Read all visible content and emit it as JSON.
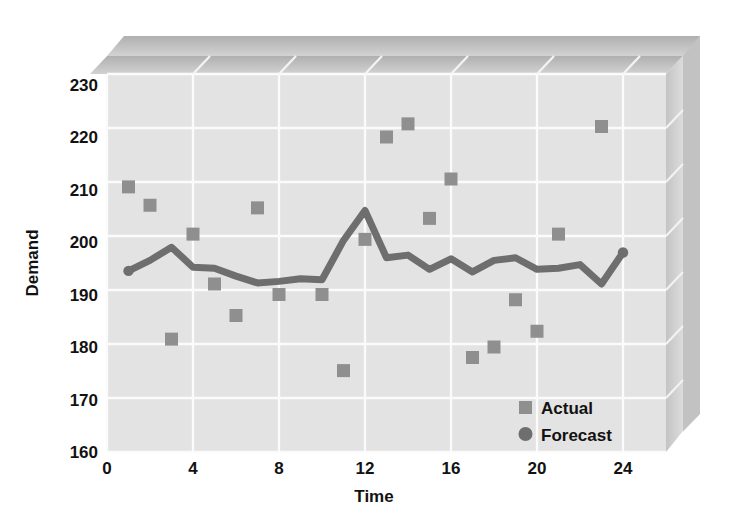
{
  "chart_data": {
    "type": "scatter",
    "title": "",
    "xlabel": "Time",
    "ylabel": "Demand",
    "xlim": [
      0,
      26
    ],
    "ylim": [
      160,
      232
    ],
    "xticks": [
      0,
      4,
      8,
      12,
      16,
      20,
      24
    ],
    "yticks": [
      160,
      170,
      180,
      190,
      200,
      210,
      220,
      230
    ],
    "grid": true,
    "legend_position": "bottom-right",
    "x": [
      1,
      2,
      3,
      4,
      5,
      6,
      7,
      8,
      9,
      10,
      11,
      12,
      13,
      14,
      15,
      16,
      17,
      18,
      19,
      20,
      21,
      22,
      23,
      24
    ],
    "series": [
      {
        "name": "Actual",
        "marker": "square",
        "color": "#8f8f8f",
        "x": [
          1,
          2,
          3,
          4,
          5,
          6,
          7,
          8,
          10,
          11,
          12,
          13,
          14,
          15,
          16,
          17,
          18,
          19,
          20,
          21,
          23
        ],
        "values": [
          210.5,
          207,
          181.5,
          201.5,
          192,
          186,
          206.5,
          190,
          190,
          175.5,
          200.5,
          220,
          222.5,
          204.5,
          212,
          178,
          180,
          189,
          183,
          201.5,
          222
        ]
      },
      {
        "name": "Forecast",
        "marker": "circle",
        "color": "#6e6e6e",
        "x": [
          1,
          2,
          3,
          4,
          5,
          6,
          7,
          8,
          9,
          10,
          11,
          12,
          13,
          14,
          15,
          16,
          17,
          18,
          19,
          20,
          21,
          22,
          23,
          24
        ],
        "values": [
          194.5,
          196.5,
          199,
          195.2,
          195,
          193.5,
          192.2,
          192.5,
          193,
          192.8,
          200.3,
          206,
          197,
          197.5,
          194.8,
          196.8,
          194.3,
          196.5,
          197,
          194.8,
          195,
          195.7,
          192,
          198
        ]
      }
    ]
  },
  "axes": {
    "ylabel": "Demand",
    "xlabel": "Time",
    "yticks": [
      "230",
      "220",
      "210",
      "200",
      "190",
      "180",
      "170",
      "160"
    ],
    "xticks": [
      "0",
      "4",
      "8",
      "12",
      "16",
      "20",
      "24"
    ]
  },
  "legend": {
    "items": [
      {
        "label": "Actual",
        "marker": "square"
      },
      {
        "label": "Forecast",
        "marker": "circle"
      }
    ]
  },
  "colors": {
    "plot_background": "#e3e3e3",
    "wall_shade": "#cfcfcf",
    "ceiling_shade": "#b8b8b8",
    "gridline": "#fbfbfb",
    "actual_marker": "#8f8f8f",
    "forecast_line": "#6e6e6e",
    "text": "#121212",
    "page_background": "#ffffff"
  }
}
